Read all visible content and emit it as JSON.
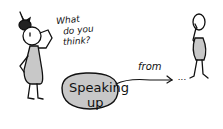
{
  "illustration": {
    "speech_question": [
      "What",
      "do you",
      "think?"
    ],
    "bubble_text": [
      "Speaking",
      "up"
    ],
    "arrow_label": "from",
    "trailing": "...",
    "colors": {
      "ink": "#111111",
      "fill": "#c8c8c8",
      "background": "#ffffff"
    }
  }
}
